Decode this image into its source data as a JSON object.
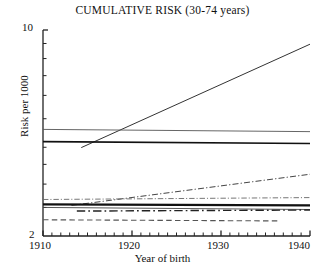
{
  "chart_data": {
    "type": "line",
    "title": "CUMULATIVE RISK (30-74 years)",
    "xlabel": "Year of birth",
    "ylabel": "Risk per 1000",
    "xlim": [
      1910,
      1940
    ],
    "ylim": [
      2,
      10
    ],
    "yscale": "log",
    "grid": false,
    "legend": "none",
    "xticks": [
      1910,
      1920,
      1930,
      1940
    ],
    "xtick_labels": [
      "1910",
      "1920",
      "1930",
      "1940"
    ],
    "xminor_tick_step": 1,
    "yticks": [
      2,
      10
    ],
    "ytick_labels": [
      "2",
      "10"
    ],
    "yminor_ticks": [
      2.5,
      3,
      3.5,
      4,
      5,
      6,
      7,
      8,
      9
    ],
    "series": [
      {
        "name": "rising-solid",
        "style": "solid",
        "width": 1.0,
        "color": "#333333",
        "x": [
          1914.3,
          1940
        ],
        "values": [
          3.99,
          8.95
        ]
      },
      {
        "name": "upper-thin-solid",
        "style": "solid",
        "width": 0.9,
        "color": "#555555",
        "x": [
          1910,
          1940
        ],
        "values": [
          4.6,
          4.52
        ]
      },
      {
        "name": "upper-thick-solid",
        "style": "solid",
        "width": 1.7,
        "color": "#111111",
        "x": [
          1910,
          1940
        ],
        "values": [
          4.18,
          4.12
        ]
      },
      {
        "name": "rising-dashdot",
        "style": "dashdot",
        "width": 1.0,
        "color": "#444444",
        "x": [
          1913.2,
          1940
        ],
        "values": [
          2.54,
          3.24
        ]
      },
      {
        "name": "cluster-dashdot-upper",
        "style": "dashdot",
        "width": 0.9,
        "color": "#666666",
        "x": [
          1910,
          1940
        ],
        "values": [
          2.66,
          2.7
        ]
      },
      {
        "name": "cluster-thick-solid",
        "style": "solid",
        "width": 2.2,
        "color": "#111111",
        "x": [
          1910,
          1940
        ],
        "values": [
          2.56,
          2.54
        ]
      },
      {
        "name": "cluster-thin-solid",
        "style": "solid",
        "width": 0.9,
        "color": "#444444",
        "x": [
          1910,
          1940
        ],
        "values": [
          2.5,
          2.46
        ]
      },
      {
        "name": "cluster-dashdot-lower",
        "style": "dashdot",
        "width": 1.4,
        "color": "#222222",
        "x": [
          1913.8,
          1940
        ],
        "values": [
          2.43,
          2.45
        ]
      },
      {
        "name": "lower-dashed",
        "style": "dashed",
        "width": 1.1,
        "color": "#555555",
        "x": [
          1910,
          1936.5
        ],
        "values": [
          2.27,
          2.25
        ]
      }
    ]
  }
}
